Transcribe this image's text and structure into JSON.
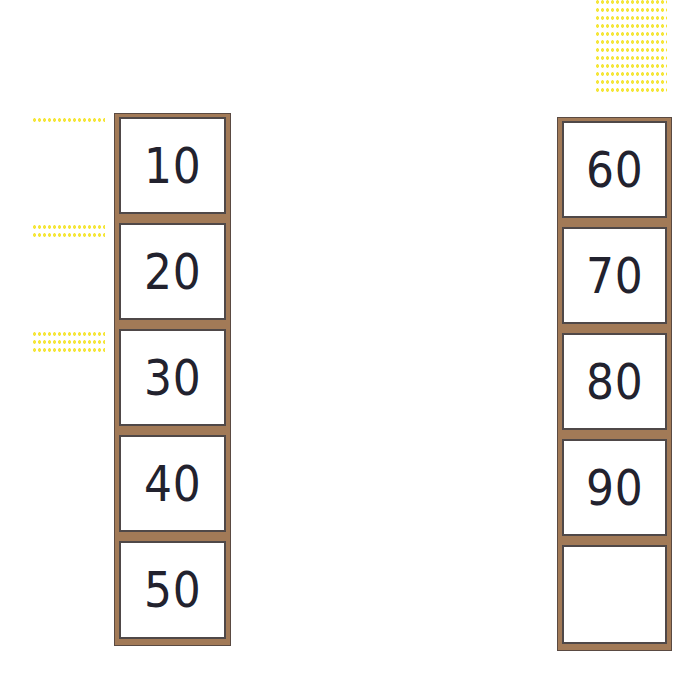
{
  "columns": [
    {
      "id": "left",
      "cells": [
        "10",
        "20",
        "30",
        "40",
        "50"
      ]
    },
    {
      "id": "right",
      "cells": [
        "60",
        "70",
        "80",
        "90",
        ""
      ]
    }
  ],
  "yellow_marks": [
    {
      "position": "left of 10",
      "lines": 1
    },
    {
      "position": "left of 20",
      "lines": 2
    },
    {
      "position": "left of 30",
      "lines": 3
    },
    {
      "position": "above right column",
      "lines": 12
    }
  ],
  "colors": {
    "frame": "#a27a57",
    "cell_border": "#4f4848",
    "text": "#22222e",
    "marks": "#f5e63a"
  }
}
